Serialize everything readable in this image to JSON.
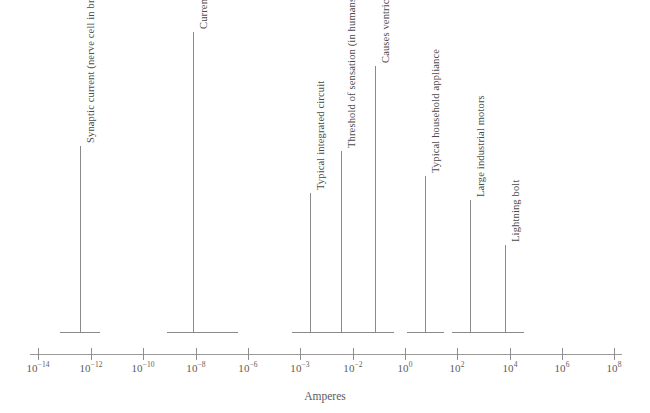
{
  "chart_data": {
    "type": "scatter",
    "title": "",
    "xlabel": "Amperes",
    "ylabel": "",
    "grid": false,
    "legend": "none",
    "scale": "log-irregular",
    "tick_labels": [
      {
        "mantissa": "10",
        "exponent": "−14",
        "value": 1e-14
      },
      {
        "mantissa": "10",
        "exponent": "−12",
        "value": 1e-12
      },
      {
        "mantissa": "10",
        "exponent": "−10",
        "value": 1e-10
      },
      {
        "mantissa": "10",
        "exponent": "−8",
        "value": 1e-08
      },
      {
        "mantissa": "10",
        "exponent": "−6",
        "value": 1e-06
      },
      {
        "mantissa": "10",
        "exponent": "−3",
        "value": 0.001
      },
      {
        "mantissa": "10",
        "exponent": "−2",
        "value": 0.01
      },
      {
        "mantissa": "10",
        "exponent": "0",
        "value": 1
      },
      {
        "mantissa": "10",
        "exponent": "2",
        "value": 100
      },
      {
        "mantissa": "10",
        "exponent": "4",
        "value": 10000
      },
      {
        "mantissa": "10",
        "exponent": "6",
        "value": 1000000
      },
      {
        "mantissa": "10",
        "exponent": "8",
        "value": 100000000
      }
    ],
    "annotations": [
      {
        "label": "Synaptic current (nerve cell in brain)",
        "value": 1e-13,
        "range": false
      },
      {
        "label": "Current of each memory cell in integrated circuit memory",
        "value": 1e-08,
        "range": true
      },
      {
        "label": "Typical integrated circuit",
        "value": 0.001,
        "range": false
      },
      {
        "label": "Threshold of sensation (in humans)",
        "value": 0.005,
        "range": false
      },
      {
        "label": "Causes ventricular fibrillation (fatal to humans)",
        "value": 0.08,
        "range": false
      },
      {
        "label": "Typical household appliance",
        "value": 3,
        "range": false
      },
      {
        "label": "Large industrial motors",
        "value": 200,
        "range": false
      },
      {
        "label": "Lightning bolt",
        "value": 3000,
        "range": false
      }
    ]
  },
  "axis": {
    "title": "Amperes",
    "ticks": [
      {
        "id": "tick-1e-14",
        "x": 38,
        "text": "10",
        "exp": "−14"
      },
      {
        "id": "tick-1e-12",
        "x": 91,
        "text": "10",
        "exp": "−12"
      },
      {
        "id": "tick-1e-10",
        "x": 143,
        "text": "10",
        "exp": "−10"
      },
      {
        "id": "tick-1e-8",
        "x": 196,
        "text": "10",
        "exp": "−8"
      },
      {
        "id": "tick-1e-6",
        "x": 248,
        "text": "10",
        "exp": "−6"
      },
      {
        "id": "tick-1e-3",
        "x": 300,
        "text": "10",
        "exp": "−3"
      },
      {
        "id": "tick-1e-2",
        "x": 353,
        "text": "10",
        "exp": "−2"
      },
      {
        "id": "tick-1e0",
        "x": 405,
        "text": "10",
        "exp": "0"
      },
      {
        "id": "tick-1e2",
        "x": 457,
        "text": "10",
        "exp": "2"
      },
      {
        "id": "tick-1e4",
        "x": 510,
        "text": "10",
        "exp": "4"
      },
      {
        "id": "tick-1e6",
        "x": 562,
        "text": "10",
        "exp": "6"
      },
      {
        "id": "tick-1e8",
        "x": 614,
        "text": "10",
        "exp": "8"
      }
    ]
  },
  "annotations": [
    {
      "id": "synaptic-current",
      "label": "Synaptic current (nerve cell in brain)",
      "stem_x": 80,
      "stem_top": 146,
      "stem_bottom": 332,
      "base_left": 60,
      "base_width": 40,
      "label_x": 85,
      "label_y": 143
    },
    {
      "id": "memory-cell-current",
      "label": "Current of each memory cell in integrated circuit memory",
      "stem_x": 193,
      "stem_top": 32,
      "stem_bottom": 332,
      "base_left": 167,
      "base_width": 71,
      "label_x": 198,
      "label_y": 29
    },
    {
      "id": "typical-integrated-circuit",
      "label": "Typical integrated circuit",
      "stem_x": 310,
      "stem_top": 193,
      "stem_bottom": 332,
      "base_left": 292,
      "base_width": 37,
      "label_x": 315,
      "label_y": 190
    },
    {
      "id": "threshold-of-sensation",
      "label": "Threshold of sensation (in humans)",
      "stem_x": 341,
      "stem_top": 151,
      "stem_bottom": 332,
      "base_left": 323,
      "base_width": 37,
      "label_x": 346,
      "label_y": 148
    },
    {
      "id": "ventricular-fibrillation",
      "label": "Causes ventricular fibrillation (fatal to humans)",
      "stem_x": 375,
      "stem_top": 66,
      "stem_bottom": 332,
      "base_left": 357,
      "base_width": 37,
      "label_x": 380,
      "label_y": 63
    },
    {
      "id": "household-appliance",
      "label": "Typical household appliance",
      "stem_x": 425,
      "stem_top": 176,
      "stem_bottom": 332,
      "base_left": 407,
      "base_width": 37,
      "label_x": 430,
      "label_y": 173
    },
    {
      "id": "industrial-motors",
      "label": "Large industrial motors",
      "stem_x": 470,
      "stem_top": 200,
      "stem_bottom": 332,
      "base_left": 452,
      "base_width": 37,
      "label_x": 475,
      "label_y": 197
    },
    {
      "id": "lightning-bolt",
      "label": "Lightning bolt",
      "stem_x": 505,
      "stem_top": 245,
      "stem_bottom": 332,
      "base_left": 487,
      "base_width": 37,
      "label_x": 510,
      "label_y": 242
    }
  ]
}
